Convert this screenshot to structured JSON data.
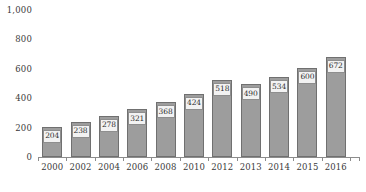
{
  "chart_data": {
    "type": "bar",
    "title": "",
    "subtitle": "",
    "xlabel": "",
    "ylabel": "",
    "categories": [
      "2000",
      "2002",
      "2004",
      "2006",
      "2008",
      "2010",
      "2012",
      "2013",
      "2014",
      "2015",
      "2016"
    ],
    "values": [
      204,
      238,
      278,
      321,
      368,
      424,
      518,
      490,
      534,
      600,
      672
    ],
    "data_labels": [
      "204",
      "238",
      "278",
      "321",
      "368",
      "424",
      "518",
      "490",
      "534",
      "600",
      "672"
    ],
    "ylim": [
      0,
      1000
    ],
    "y_ticks": [
      0,
      200,
      400,
      600,
      800,
      1000
    ],
    "y_tick_labels": [
      "0",
      "200",
      "400",
      "600",
      "800",
      "1,000"
    ],
    "grid": false,
    "legend": null,
    "legend_position": "none",
    "annotations": [],
    "colors": {
      "bar_fill": "#9d9d9d",
      "bar_border": "#707070",
      "label_box_fill": "#f2f2f2",
      "label_box_border": "#8e8e8e",
      "axis_line": "#8c8c8c",
      "text": "#3a3a3a",
      "background": "#ffffff"
    }
  }
}
